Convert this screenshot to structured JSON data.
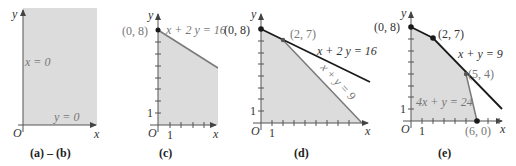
{
  "figure": {
    "colors": {
      "shade": "#dcdcdc",
      "axis": "#555555",
      "line_dark": "#1a1a1a",
      "line_gray": "#7a7a7a",
      "label_gray": "#777777",
      "label_dark": "#333333"
    },
    "panels": [
      {
        "id": "ab",
        "caption": "(a) – (b)",
        "axis_x_label": "x",
        "axis_y_label": "y",
        "origin_label": "O",
        "constraints": [
          {
            "label": "x = 0"
          },
          {
            "label": "y = 0"
          }
        ]
      },
      {
        "id": "c",
        "caption": "(c)",
        "axis_x_label": "x",
        "axis_y_label": "y",
        "origin_label": "O",
        "tick_label_x": "1",
        "tick_label_y": "1",
        "points": [
          {
            "label": "(0, 8)"
          }
        ],
        "constraints": [
          {
            "label": "x + 2 y = 16"
          }
        ]
      },
      {
        "id": "d",
        "caption": "(d)",
        "axis_x_label": "x",
        "axis_y_label": "y",
        "origin_label": "O",
        "tick_label_x": "1",
        "tick_label_y": "1",
        "points": [
          {
            "label": "(0, 8)"
          },
          {
            "label": "(2, 7)"
          }
        ],
        "constraints": [
          {
            "label": "x + 2 y = 16"
          },
          {
            "label": "x + y = 9"
          }
        ]
      },
      {
        "id": "e",
        "caption": "(e)",
        "axis_x_label": "x",
        "axis_y_label": "y",
        "origin_label": "O",
        "tick_label_x": "1",
        "tick_label_y": "1",
        "points": [
          {
            "label": "(0, 8)"
          },
          {
            "label": "(2, 7)"
          },
          {
            "label": "(5, 4)"
          },
          {
            "label": "(6, 0)"
          }
        ],
        "constraints": [
          {
            "label": "x + y = 9"
          },
          {
            "label": "4x + y = 24"
          }
        ]
      }
    ]
  }
}
